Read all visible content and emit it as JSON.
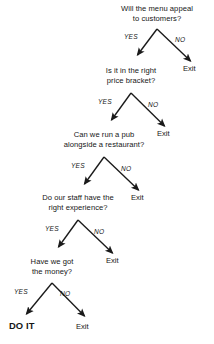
{
  "diagram": {
    "orientation": "top-down-left-cascading",
    "line_color": "#1a1a1a",
    "text_color": "#161616",
    "background": "#ffffff",
    "yes_label": "YES",
    "no_label": "NO"
  },
  "nodes": [
    {
      "id": "q1",
      "kind": "decision",
      "line1": "Will the menu appeal",
      "line2": "to customers?",
      "yes_label": "YES",
      "no_label": "NO",
      "no_target": "Exit"
    },
    {
      "id": "q2",
      "kind": "decision",
      "line1": "Is it in the right",
      "line2": "price bracket?",
      "yes_label": "YES",
      "no_label": "NO",
      "no_target": "Exit"
    },
    {
      "id": "q3",
      "kind": "decision",
      "line1": "Can we run a pub",
      "line2": "alongside a restaurant?",
      "yes_label": "YES",
      "no_label": "NO",
      "no_target": "Exit"
    },
    {
      "id": "q4",
      "kind": "decision",
      "line1": "Do our staff have the",
      "line2": "right experience?",
      "yes_label": "YES",
      "no_label": "NO",
      "no_target": "Exit"
    },
    {
      "id": "q5",
      "kind": "decision",
      "line1": "Have we got",
      "line2": "the money?",
      "yes_label": "YES",
      "no_label": "NO",
      "no_target": "Exit"
    }
  ],
  "terminals": {
    "exit1": "Exit",
    "exit2": "Exit",
    "exit3": "Exit",
    "exit4": "Exit",
    "exit5": "Exit",
    "success": "DO IT"
  }
}
